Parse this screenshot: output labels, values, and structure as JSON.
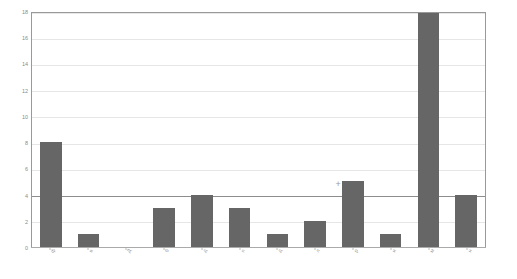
{
  "chart_data": {
    "type": "bar",
    "title": "",
    "subtitle": "",
    "xlabel": "",
    "ylabel": "",
    "categories": [
      "ф",
      "в",
      "Д",
      "б",
      "д",
      "п",
      "д",
      "л",
      "р",
      "и",
      "м",
      "н"
    ],
    "values": [
      8,
      1,
      0,
      3,
      4,
      3,
      1,
      2,
      5,
      1,
      18,
      4
    ],
    "ylim": [
      0,
      18
    ],
    "yticks": [
      0,
      2,
      4,
      6,
      8,
      10,
      12,
      14,
      16,
      18
    ],
    "ytick_labels": [
      "0",
      "2",
      "4",
      "6",
      "8",
      "10",
      "12",
      "14",
      "16",
      "18"
    ],
    "grid": true,
    "major_gridline_value": 4,
    "legend": null,
    "legend_position": "none",
    "bar_color": "#666666",
    "gridline_color": "#e6e6e6",
    "major_gridline_color": "#8d8d8d",
    "frame_color": "#999999",
    "annotations": [
      {
        "label": "+",
        "x_value": 7.6,
        "y_value": 4.85
      }
    ]
  }
}
